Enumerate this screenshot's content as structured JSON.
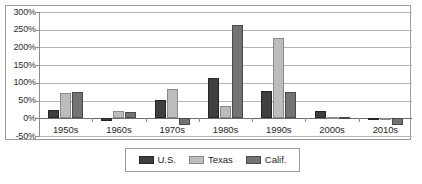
{
  "chart_data": {
    "type": "bar",
    "title": "",
    "subtitle": "",
    "xlabel": "",
    "ylabel": "",
    "ylim": [
      -50,
      300
    ],
    "ytick_labels": [
      "300%",
      "250%",
      "200%",
      "150%",
      "100%",
      "50%",
      "0%",
      "-50%"
    ],
    "ytick_values": [
      300,
      250,
      200,
      150,
      100,
      50,
      0,
      -50
    ],
    "ytick_suffix": "%",
    "grid": true,
    "legend_position": "bottom",
    "categories": [
      "1950s",
      "1960s",
      "1970s",
      "1980s",
      "1990s",
      "2000s",
      "2010s"
    ],
    "series": [
      {
        "name": "U.S.",
        "color": "#3f3f3f",
        "values": [
          23,
          -7,
          52,
          115,
          77,
          21,
          -3
        ]
      },
      {
        "name": "Texas",
        "color": "#bcbcbc",
        "values": [
          71,
          20,
          84,
          36,
          227,
          5,
          -4
        ]
      },
      {
        "name": "Calif.",
        "color": "#727272",
        "values": [
          73,
          18,
          -18,
          264,
          73,
          4,
          -20
        ]
      }
    ]
  },
  "legend": {
    "items": [
      {
        "label": "U.S.",
        "key": "us"
      },
      {
        "label": "Texas",
        "key": "tx"
      },
      {
        "label": "Calif.",
        "key": "ca"
      }
    ]
  },
  "colors": {
    "series_us": "#3f3f3f",
    "series_tx": "#bcbcbc",
    "series_ca": "#727272",
    "gridline": "#b4b4b4",
    "frame": "#9a9a9a",
    "axis": "#8d8d8d",
    "text": "#1f1f1f",
    "background": "#ffffff"
  }
}
